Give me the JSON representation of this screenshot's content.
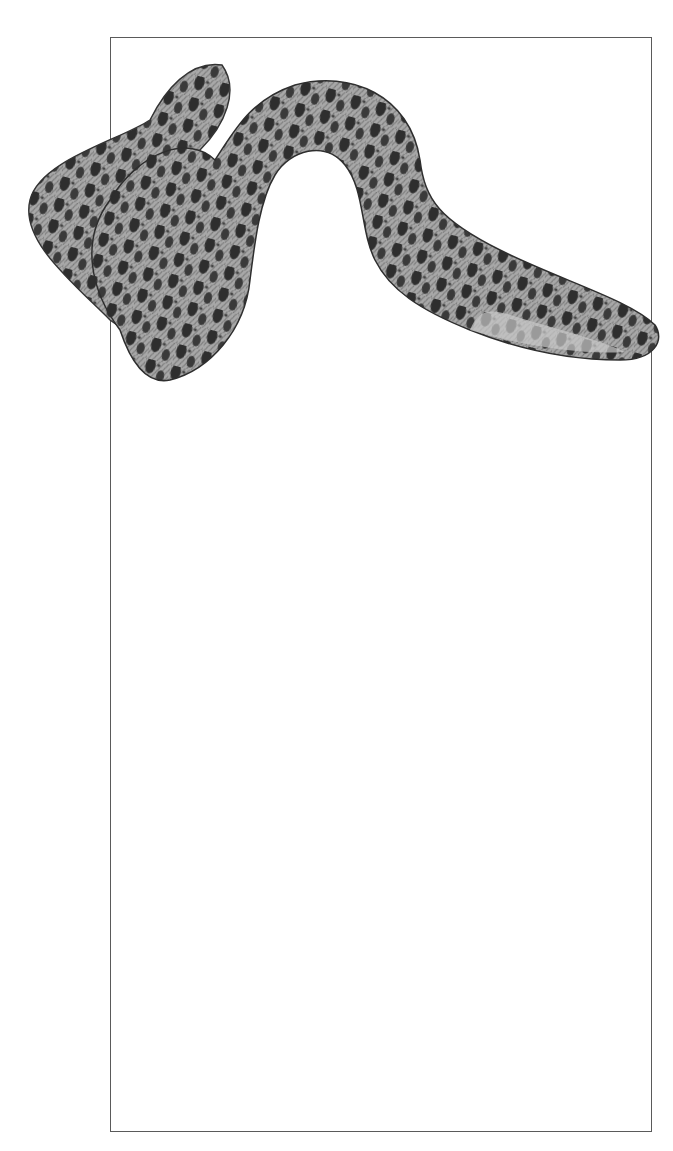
{
  "figure": {
    "caption_prefix": "Figure 97:",
    "caption_title": "Lampreys"
  },
  "species": [
    {
      "number": "1.",
      "name": "Sea lamprey",
      "label": "1. Sea lamprey"
    },
    {
      "number": "2.",
      "name": "River lamprey",
      "label": "2. River lamprey"
    },
    {
      "number": "3.",
      "name": "Brook lamprey",
      "label": "3. Brook lamprey"
    }
  ],
  "colors": {
    "frame": "#5a5a5a",
    "ink": "#2b2b2b",
    "engraving_mid": "#8a8a8a",
    "engraving_dark": "#3a3a3a"
  }
}
